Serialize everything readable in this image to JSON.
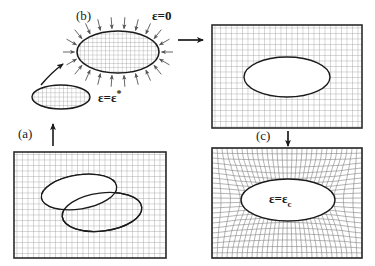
{
  "figure": {
    "type": "eshelby-inclusion-diagram",
    "width": 375,
    "height": 266,
    "background": "#ffffff",
    "line_color": "#1a1a1a",
    "grid_color": "#8c8c8c",
    "arrow_color": "#4d4d4d"
  },
  "labels": {
    "step_a": "(a)",
    "step_b": "(b)",
    "step_c": "(c)",
    "strain_free": "ε=0",
    "strain_star_prefix": "ε=ε",
    "strain_star_sup": "*",
    "strain_c_prefix": "ε=ε",
    "strain_c_sub": "c"
  },
  "panels": [
    {
      "name": "matrix-with-cut-inclusion",
      "position": "bottom-left",
      "x": 14,
      "y": 152,
      "w": 152,
      "h": 106,
      "grid": "uniform",
      "grid_spacing": 5.5,
      "ellipses": [
        {
          "cx": 65,
          "cy": 40,
          "rx": 38,
          "ry": 17,
          "rot": -9,
          "fill": "#ffffff"
        },
        {
          "cx": 88,
          "cy": 60,
          "rx": 40,
          "ry": 19,
          "rot": -7,
          "fill": "#ffffff"
        }
      ]
    },
    {
      "name": "matrix-with-hole",
      "position": "top-right",
      "x": 212,
      "y": 25,
      "w": 150,
      "h": 103,
      "grid": "uniform",
      "grid_spacing": 5.5,
      "ellipses": [
        {
          "cx": 75,
          "cy": 52,
          "rx": 43,
          "ry": 20,
          "rot": 0,
          "fill": "#ffffff"
        }
      ]
    },
    {
      "name": "matrix-with-relaxed-inclusion",
      "position": "bottom-right",
      "x": 212,
      "y": 148,
      "w": 150,
      "h": 110,
      "grid": "distorted",
      "grid_spacing": 5.0,
      "ellipses": [
        {
          "cx": 76,
          "cy": 52,
          "rx": 47,
          "ry": 21,
          "rot": 0,
          "fill": "#ffffff"
        }
      ]
    }
  ],
  "free_bodies": [
    {
      "name": "inclusion-unstrained",
      "cx": 61,
      "cy": 97,
      "rx": 29,
      "ry": 12,
      "fill": "grid",
      "label": "strain_star"
    },
    {
      "name": "inclusion-compressed",
      "cx": 118,
      "cy": 52,
      "rx": 41,
      "ry": 21,
      "fill": "grid",
      "label": "strain_free",
      "traction_arrows": 22
    }
  ],
  "arrows": [
    {
      "name": "arrow-a-to-b",
      "kind": "curved",
      "from": "inclusion-unstrained",
      "to": "inclusion-compressed"
    },
    {
      "name": "arrow-up-to-a",
      "kind": "straight-up",
      "note": "from bottom-left panel upward"
    },
    {
      "name": "arrow-b-to-hole",
      "kind": "straight-right",
      "note": "to top-right panel"
    },
    {
      "name": "arrow-hole-to-c",
      "kind": "straight-down",
      "note": "to bottom-right panel"
    }
  ]
}
